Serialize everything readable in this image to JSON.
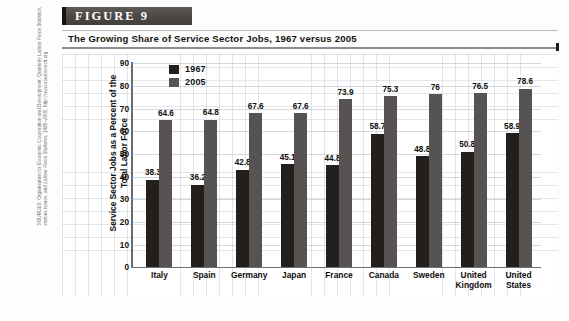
{
  "figure": {
    "badge_label": "FIGURE  9",
    "title": "The Growing Share of Service Sector Jobs, 1967 versus 2005",
    "source_prefix": "SOURCES: Organisation for Economic Cooperation and Development, Quarterly ",
    "source_italic": "Labour Force Statistics, ",
    "source_middle": "various issues, and ",
    "source_italic2": "Labour Force Statistics, 1985–2005, ",
    "source_url": "http://www.sourceoecd.org"
  },
  "colors": {
    "series_1967": "#231f1d",
    "series_2005": "#565352",
    "badge_bg": "#4a4744",
    "axis": "#4a4a4a",
    "grid": "#a0afbe"
  },
  "chart_data": {
    "type": "bar",
    "title": "The Growing Share of Service Sector Jobs, 1967 versus 2005",
    "xlabel": "",
    "ylabel": "Service Sector Jobs as a Percent of the Total Labor Force",
    "ylim": [
      0,
      90
    ],
    "yticks": [
      0,
      10,
      20,
      30,
      40,
      50,
      60,
      70,
      80,
      90
    ],
    "grid": true,
    "legend_position": "top-left-inside",
    "categories": [
      "Italy",
      "Spain",
      "Germany",
      "Japan",
      "France",
      "Canada",
      "Sweden",
      "United Kingdom",
      "United States"
    ],
    "series": [
      {
        "name": "1967",
        "color": "#231f1d",
        "values": [
          38.3,
          36.2,
          42.8,
          45.1,
          44.8,
          58.7,
          48.8,
          50.8,
          58.9
        ],
        "labels": [
          "38.3",
          "36.2",
          "42.8",
          "45.1",
          "44.8",
          "58.7",
          "48.8",
          "50.8",
          "58.9"
        ]
      },
      {
        "name": "2005",
        "color": "#565352",
        "values": [
          64.6,
          64.8,
          67.6,
          67.6,
          73.9,
          75.3,
          76,
          76.5,
          78.6
        ],
        "labels": [
          "64.6",
          "64.8",
          "67.6",
          "67.6",
          "73.9",
          "75.3",
          "76",
          "76.5",
          "78.6"
        ]
      }
    ]
  }
}
